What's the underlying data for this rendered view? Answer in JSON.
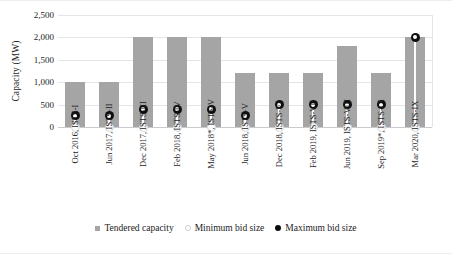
{
  "chart_data": {
    "type": "bar",
    "title": "",
    "subtitle": "",
    "xlabel": "",
    "ylabel": "Capacity (MW)",
    "ylim": [
      0,
      2500
    ],
    "ytick_values": [
      0,
      500,
      1000,
      1500,
      2000,
      2500
    ],
    "ytick_labels": [
      "0",
      "500",
      "1,000",
      "1,500",
      "2,000",
      "2,500"
    ],
    "grid": true,
    "legend_position": "bottom-center",
    "categories": [
      "Oct 2016, ISTS-I",
      "Jun 2017, ISTS-II",
      "Dec 2017, ISTS-III",
      "Feb 2018, ISTS-IV",
      "May 2018*, ISTS-V",
      "Jun 2018, ISTS-V",
      "Dec 2018, ISTS-VI",
      "Feb 2019, ISTS-VII",
      "Jun 2019, ISTS-VIII",
      "Sep 2019*, ISTS-IX",
      "Mar 2020, ISTS-IX"
    ],
    "series": [
      {
        "name": "Tendered capacity",
        "type": "bar",
        "color": "#a5a5a5",
        "values": [
          1000,
          1000,
          2000,
          2000,
          2000,
          1200,
          1200,
          1200,
          1800,
          1200,
          2000
        ]
      },
      {
        "name": "Minimum bid size",
        "type": "scatter",
        "color": "#fcfcfc",
        "values": [
          0,
          0,
          0,
          0,
          0,
          0,
          0,
          0,
          0,
          0,
          0
        ]
      },
      {
        "name": "Maximum bid size",
        "type": "scatter",
        "color": "#0d0d0d",
        "values": [
          250,
          250,
          400,
          400,
          400,
          250,
          500,
          500,
          500,
          500,
          2000
        ]
      }
    ]
  },
  "axis": {
    "y_title": "Capacity (MW)"
  },
  "legend": {
    "items": [
      {
        "label": "Tendered capacity",
        "marker": "square-gray"
      },
      {
        "label": "Minimum bid size",
        "marker": "circle-open"
      },
      {
        "label": "Maximum bid size",
        "marker": "circle-filled"
      }
    ]
  }
}
